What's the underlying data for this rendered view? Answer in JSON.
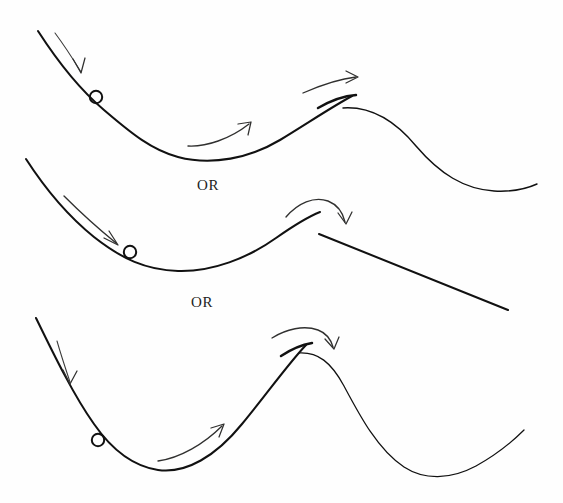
{
  "figure": {
    "kind": "hand-drawn-physics-sketch",
    "width": 563,
    "height": 503,
    "background_color": "#fefefe",
    "ink_color": "#111111",
    "arrow_color": "#30302f"
  },
  "connectors": [
    {
      "id": "or-1",
      "label": "OR",
      "x": 197,
      "y": 177
    },
    {
      "id": "or-2",
      "label": "OR",
      "x": 191,
      "y": 294
    }
  ],
  "panels": [
    {
      "id": "panel-1",
      "name": "gentle-hill",
      "description": "Ball rolls down a concave slope, through a valley, over a low rounded hill and down into a shallow valley on the right.",
      "ball": {
        "cx": 96,
        "cy": 97,
        "r": 6.2
      },
      "paths": [
        {
          "name": "slope-down-and-up-to-peak",
          "weight": "main",
          "d": "M 38 31 C 58 62 78 88 104 110 C 132 134 152 150 178 157 C 212 166 250 158 280 140 C 308 123 330 108 352 96"
        },
        {
          "name": "peak-cap-heavy",
          "weight": "heavy",
          "d": "M 318 108 C 330 101 342 96 356 95"
        },
        {
          "name": "descending-right-limb",
          "weight": "thin",
          "d": "M 343 108 C 372 106 396 122 416 146 C 440 174 464 189 494 191 C 512 192 526 189 537 184"
        }
      ],
      "arrows": [
        {
          "name": "arrow-down-left",
          "style": "thin",
          "d": "M 55 33 C 64 45 73 59 81 72",
          "head": "M 73 59 L 81 73 L 85 58"
        },
        {
          "name": "arrow-up-middle",
          "style": "normal",
          "d": "M 188 146 C 206 147 230 139 249 124",
          "head": "M 238 124 L 251 122 L 248 135"
        },
        {
          "name": "arrow-over-peak",
          "style": "normal",
          "d": "M 303 93 C 319 86 338 79 356 77",
          "head": "M 346 71 L 358 77 L 346 83"
        }
      ]
    },
    {
      "id": "panel-2",
      "name": "sharp-peak-then-straight-drop",
      "description": "Ball rolls down a concave slope, through a valley, up to a sharp corner peak and then falls along a straight line to the lower right.",
      "ball": {
        "cx": 130,
        "cy": 252,
        "r": 6.2
      },
      "paths": [
        {
          "name": "valley-up-to-sharp-peak",
          "weight": "main",
          "d": "M 26 159 C 46 190 68 216 94 237 C 122 259 146 270 178 271 C 212 272 248 258 276 238 C 296 224 310 216 320 212"
        },
        {
          "name": "straight-drop",
          "weight": "main",
          "d": "M 319 234 L 508 310"
        }
      ],
      "arrows": [
        {
          "name": "arrow-down-left",
          "style": "normal",
          "d": "M 64 196 C 82 214 100 230 116 243",
          "head": "M 104 238 L 118 245 L 109 231"
        },
        {
          "name": "arrow-arc-over-peak",
          "style": "normal",
          "d": "M 286 217 C 298 203 314 196 328 201 C 338 205 343 213 345 222",
          "head": "M 338 213 L 346 224 L 352 212"
        }
      ]
    },
    {
      "id": "panel-3",
      "name": "tall-steep-hill",
      "description": "Ball rolls down a concave slope, through a valley, up a tall steep hill, over the crest and down into a deep valley that rises again on the right.",
      "ball": {
        "cx": 98,
        "cy": 440,
        "r": 6.2
      },
      "paths": [
        {
          "name": "valley-up-to-crest",
          "weight": "main",
          "d": "M 36 318 C 54 355 74 396 94 424 C 112 450 132 466 158 470 C 186 474 216 456 242 424 C 266 395 288 364 306 345"
        },
        {
          "name": "crest-cap-heavy",
          "weight": "heavy",
          "d": "M 281 356 C 290 350 300 345 312 343"
        },
        {
          "name": "descending-right-limb",
          "weight": "thin",
          "d": "M 299 353 C 318 352 331 362 344 386 C 360 416 378 450 404 467 C 424 480 450 480 476 466 C 496 455 512 442 524 430"
        }
      ],
      "arrows": [
        {
          "name": "arrow-down-left",
          "style": "thin",
          "d": "M 57 341 C 61 355 66 370 70 382",
          "head": "M 63 370 L 70 384 L 77 371"
        },
        {
          "name": "arrow-up-middle",
          "style": "normal",
          "d": "M 158 461 C 180 458 204 444 222 426",
          "head": "M 211 428 L 224 424 L 219 437"
        },
        {
          "name": "arrow-over-crest",
          "style": "normal",
          "d": "M 272 338 C 286 329 304 325 318 330 C 326 333 331 340 333 347",
          "head": "M 325 339 L 334 349 L 339 337"
        }
      ]
    }
  ]
}
